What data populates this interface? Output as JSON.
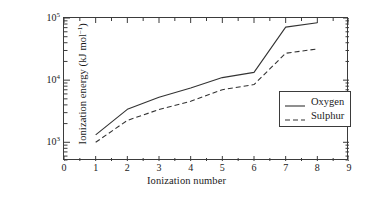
{
  "chart_data": {
    "type": "line",
    "title": "",
    "xlabel": "Ionization number",
    "ylabel": "Ionization energy (kJ mol⁻¹)",
    "ylabel_main": "Ionization energy (kJ mol",
    "ylabel_sup": "–1",
    "ylabel_tail": ")",
    "x": [
      1,
      2,
      3,
      4,
      5,
      6,
      7,
      8
    ],
    "xlim": [
      0,
      9
    ],
    "ylim": [
      500,
      100000
    ],
    "yscale": "log",
    "grid": false,
    "legend_position": "lower right",
    "xticks": [
      "0",
      "1",
      "2",
      "3",
      "4",
      "5",
      "6",
      "7",
      "8",
      "9"
    ],
    "xtick_values": [
      0,
      1,
      2,
      3,
      4,
      5,
      6,
      7,
      8,
      9
    ],
    "yticks": [
      "10³",
      "10⁴",
      "10⁵"
    ],
    "ytick_values": [
      1000,
      10000,
      100000
    ],
    "ytick_mantissa": [
      "10",
      "10",
      "10"
    ],
    "ytick_exponent": [
      "3",
      "4",
      "5"
    ],
    "series": [
      {
        "name": "Oxygen",
        "style": "solid",
        "color": "#333333",
        "values": [
          1314,
          3388,
          5301,
          7469,
          10989,
          13326,
          71330,
          84078
        ]
      },
      {
        "name": "Sulphur",
        "style": "dashed",
        "color": "#333333",
        "values": [
          1000,
          2251,
          3361,
          4564,
          7013,
          8496,
          27107,
          31719
        ]
      }
    ]
  },
  "legend": {
    "items": [
      {
        "label": "Oxygen",
        "style": "solid"
      },
      {
        "label": "Sulphur",
        "style": "dashed"
      }
    ]
  },
  "colors": {
    "axis": "#3b3b3b",
    "line": "#333333",
    "background": "#ffffff",
    "text": "#1a1a1a"
  }
}
